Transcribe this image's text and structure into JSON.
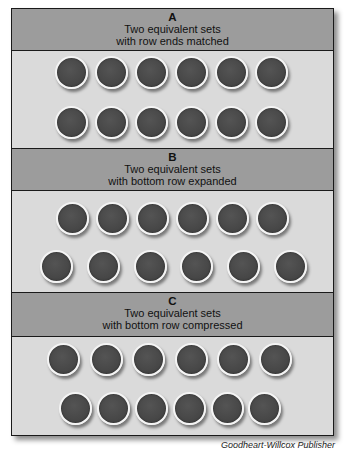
{
  "sections": [
    {
      "letter": "A",
      "line1": "Two equivalent sets",
      "line2": "with row ends matched",
      "rows": [
        {
          "count": 6,
          "centers_x": [
            72,
            112,
            152,
            192,
            232,
            272
          ],
          "center_y": 73
        },
        {
          "count": 6,
          "centers_x": [
            72,
            112,
            152,
            192,
            232,
            272
          ],
          "center_y": 123
        }
      ]
    },
    {
      "letter": "B",
      "line1": "Two equivalent sets",
      "line2": "with bottom row expanded",
      "rows": [
        {
          "count": 6,
          "centers_x": [
            73,
            113,
            153,
            193,
            233,
            273
          ],
          "center_y": 219
        },
        {
          "count": 6,
          "centers_x": [
            57,
            104,
            151,
            197,
            244,
            291
          ],
          "center_y": 267
        }
      ]
    },
    {
      "letter": "C",
      "line1": "Two equivalent sets",
      "line2": "with bottom row compressed",
      "rows": [
        {
          "count": 6,
          "centers_x": [
            64,
            107,
            149,
            192,
            234,
            276
          ],
          "center_y": 360
        },
        {
          "count": 6,
          "centers_x": [
            76,
            114,
            152,
            190,
            228,
            265
          ],
          "center_y": 409
        }
      ]
    }
  ],
  "credit": "Goodheart-Willcox Publisher",
  "colors": {
    "header_bg": "#9c9c9c",
    "body_bg": "#dadada",
    "coin_fill": "#474747",
    "coin_rim": "#f4f4f4",
    "border": "#1a1a1a"
  }
}
